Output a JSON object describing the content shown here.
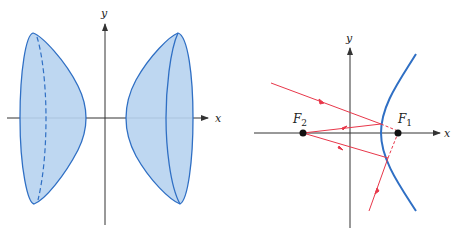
{
  "figures": {
    "left": {
      "title": "Hyperboloid of two sheets",
      "x_label": "x",
      "y_label": "y"
    },
    "right": {
      "title": "Reflection property of hyperbola",
      "x_label": "x",
      "y_label": "y",
      "focus1": "F",
      "focus1_sub": "1",
      "focus2": "F",
      "focus2_sub": "2"
    }
  },
  "colors": {
    "surface_fill": "#b7d3ef",
    "curve": "#2f6fc4",
    "ray": "#e8374a",
    "axis": "#333333"
  }
}
